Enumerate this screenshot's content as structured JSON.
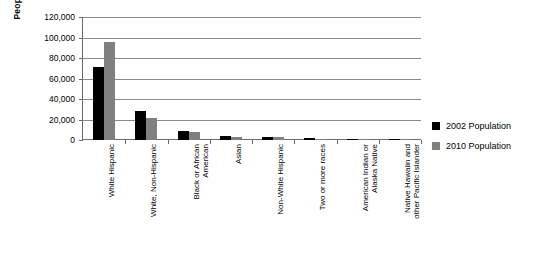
{
  "chart_data": {
    "type": "bar",
    "title": "",
    "xlabel": "",
    "ylabel": "People",
    "ylim": [
      0,
      120000
    ],
    "ytick_values": [
      120000,
      100000,
      80000,
      60000,
      40000,
      20000,
      0
    ],
    "ytick_labels": [
      "120,000",
      "100,000",
      "80,000",
      "60,000",
      "40,000",
      "20,000",
      "0"
    ],
    "grid": true,
    "legend_position": "right",
    "categories": [
      "White Hispanic",
      "White, Non-Hispanic",
      "Black or African\nAmerican",
      "Asian",
      "Non-White Hispanic",
      "Two or more races",
      "American Indian or\nAlaska Native",
      "Native Hawaiin and\nother Pacific Islander"
    ],
    "series": [
      {
        "name": "2002 Population",
        "color": "#000000",
        "values": [
          71000,
          28000,
          9000,
          3500,
          2500,
          1500,
          800,
          200
        ]
      },
      {
        "name": "2010 Population",
        "color": "#808080",
        "values": [
          95500,
          21000,
          8000,
          3000,
          3000,
          1300,
          600,
          300
        ]
      }
    ]
  },
  "legend": {
    "items": [
      {
        "label": "2002 Population",
        "color": "#000000"
      },
      {
        "label": "2010 Population",
        "color": "#808080"
      }
    ]
  }
}
